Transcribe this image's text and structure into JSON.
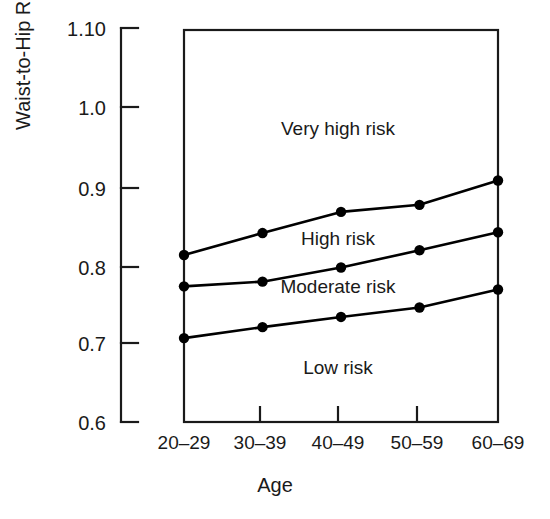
{
  "chart_data": {
    "type": "line",
    "title": "",
    "xlabel": "Age",
    "ylabel": "Waist-to-Hip Ratio",
    "categories": [
      "20–29",
      "30–39",
      "40–49",
      "50–59",
      "60–69"
    ],
    "ytick_labels": [
      "1.10",
      "1.0",
      "0.9",
      "0.8",
      "0.7",
      "0.6"
    ],
    "ytick_values": [
      1.1,
      1.0,
      0.9,
      0.8,
      0.7,
      0.6
    ],
    "ylim": [
      0.6,
      1.1
    ],
    "grid": false,
    "legend": "none",
    "marker": "filled-circle",
    "line_color": "#000000",
    "series": [
      {
        "name": "High / Very high risk boundary",
        "values": [
          0.813,
          0.841,
          0.868,
          0.877,
          0.908
        ]
      },
      {
        "name": "Moderate / High risk boundary",
        "values": [
          0.773,
          0.779,
          0.797,
          0.819,
          0.842
        ]
      },
      {
        "name": "Low / Moderate risk boundary",
        "values": [
          0.707,
          0.721,
          0.734,
          0.746,
          0.769
        ]
      }
    ],
    "annotations": [
      {
        "text": "Very high risk",
        "x_category": "40–49",
        "y": 1.005
      },
      {
        "text": "High risk",
        "x_category": "40–49",
        "y": 0.828
      },
      {
        "text": "Moderate risk",
        "x_category": "40–49",
        "y": 0.766
      },
      {
        "text": "Low risk",
        "x_category": "40–49",
        "y": 0.675
      }
    ]
  }
}
